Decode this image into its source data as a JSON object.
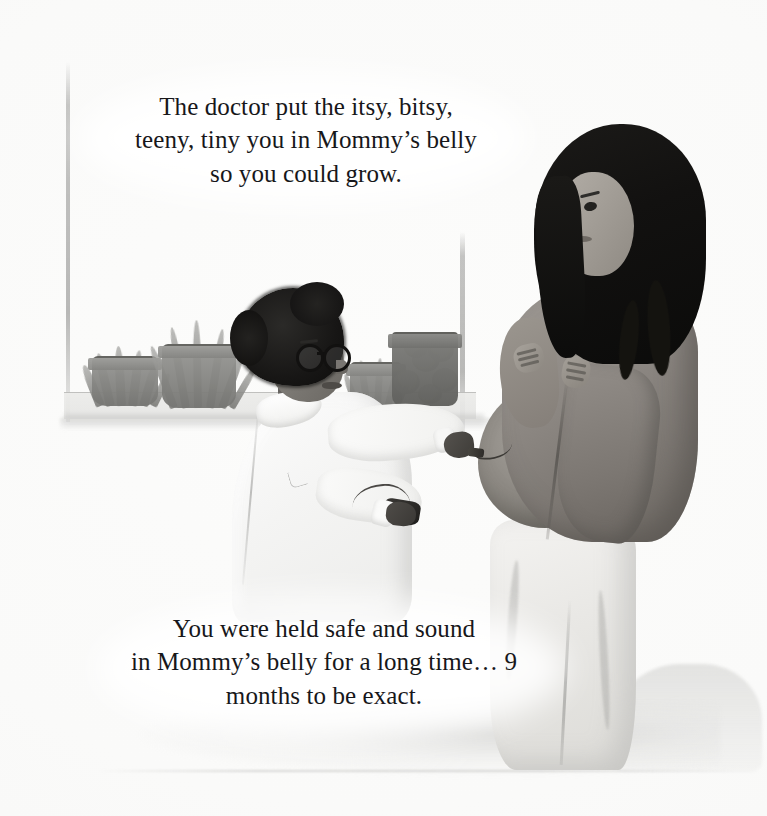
{
  "page": {
    "type": "childrens-book-illustration",
    "medium": "watercolor and pencil",
    "background_color": "#ffffff",
    "text_color": "#17171a"
  },
  "text_top": {
    "lines": [
      "The doctor put the itsy, bitsy,",
      "teeny, tiny you in Mommy’s belly",
      "so you could grow."
    ]
  },
  "text_bottom": {
    "lines": [
      "You were held safe and sound",
      "in Mommy’s belly for a long time… 9",
      "months to be exact."
    ]
  },
  "illustration": {
    "scene_name": "prenatal-checkup-scene",
    "doctor": {
      "name": "doctor-figure",
      "hair": "afro-hair",
      "glasses": "round-black-glasses",
      "clothing": "white-lab-coat",
      "holding": "fetal-doppler-device",
      "skin_tone": "#6e6b66",
      "coat_color": "#fafaf9"
    },
    "mother": {
      "name": "pregnant-woman-figure",
      "hair": "long-dark-hair",
      "top": "rose-mauve-shirt-lifted",
      "pants": "light-cream-pants",
      "belly": "exposed-pregnant-belly",
      "top_color": "#8d8883",
      "pants_color": "#e9e8e5",
      "hair_color": "#121110"
    },
    "window": {
      "name": "window-with-sill",
      "frame_color": "#96968e"
    },
    "plants": [
      {
        "name": "plant-succulent",
        "pot": "dark-round-pot",
        "foliage": "spiky-succulent"
      },
      {
        "name": "plant-snake-plant",
        "pot": "tall-gray-pot",
        "foliage": "tall-blades"
      },
      {
        "name": "plant-small-herb",
        "pot": "small-gray-pot",
        "foliage": "short-spikes"
      },
      {
        "name": "plant-flowering",
        "pot": "dark-ribbed-pot",
        "foliage": "leafy-blooms"
      }
    ]
  }
}
